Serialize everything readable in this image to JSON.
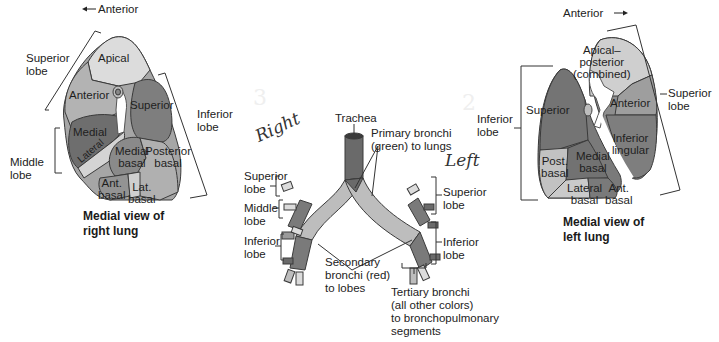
{
  "right_lung": {
    "direction_label": "Anterior",
    "direction_arrow": "←",
    "lobes": {
      "superior": "Superior\nlobe",
      "middle": "Middle\nlobe",
      "inferior": "Inferior\nlobe"
    },
    "segments": {
      "apical": "Apical",
      "anterior": "Anterior",
      "superior": "Superior",
      "medial": "Medial",
      "lateral": "Lateral",
      "medial_basal": "Medial\nbasal",
      "posterior_basal": "Posterior\nbasal",
      "ant_basal": "Ant.\nbasal",
      "lat_basal": "Lat.\nbasal"
    },
    "caption": "Medial view of\nright lung"
  },
  "bronchial_tree": {
    "trachea": "Trachea",
    "primary": "Primary bronchi\n(green) to lungs",
    "secondary": "Secondary\nbronchi (red)\nto lobes",
    "tertiary": "Tertiary bronchi\n(all other colors)\nto bronchopulmonary\nsegments",
    "right_lobes": {
      "superior": "Superior\nlobe",
      "middle": "Middle\nlobe",
      "inferior": "Inferior\nlobe"
    },
    "left_lobes": {
      "superior": "Superior\nlobe",
      "inferior": "Inferior\nlobe"
    }
  },
  "left_lung": {
    "direction_label": "Anterior",
    "direction_arrow": "→",
    "lobes": {
      "superior": "Superior\nlobe",
      "inferior": "Inferior\nlobe"
    },
    "segments": {
      "apical_posterior": "Apical–\nposterior\n(combined)",
      "anterior": "Anterior",
      "superior": "Superior",
      "inferior_lingular": "Inferior\nlingular",
      "post_basal": "Post.\nbasal",
      "medial_basal": "Medial\nbasal",
      "lateral_basal": "Lateral\nbasal",
      "ant_basal": "Ant.\nbasal"
    },
    "caption": "Medial view of\nleft lung"
  },
  "handwriting": {
    "right": "Right",
    "left": "Left",
    "faint_numbers": [
      "3",
      "2"
    ]
  },
  "colors": {
    "light": "#dcdcdc",
    "mid_light": "#c4c4c4",
    "mid": "#a6a6a6",
    "dark": "#7c7c7c",
    "darker": "#6a6a6a",
    "outline": "#333333"
  }
}
